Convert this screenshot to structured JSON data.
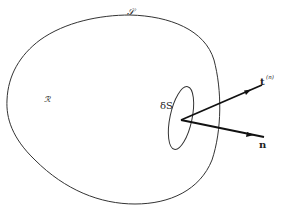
{
  "diagram": {
    "labels": {
      "boundary": "𝒮",
      "region": "ℛ",
      "surface_element": "δS",
      "traction_vector": "t",
      "traction_superscript": "(n)",
      "normal_vector": "n"
    },
    "colors": {
      "stroke": "#333333",
      "arrow": "#111111",
      "background": "#ffffff"
    }
  }
}
